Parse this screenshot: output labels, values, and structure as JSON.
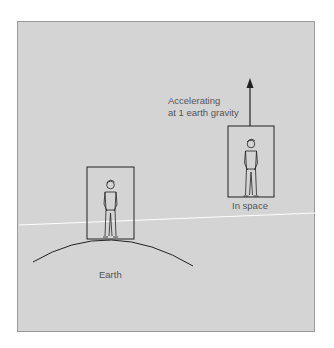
{
  "diagram": {
    "annotations": {
      "accelerating_line1": "Accelerating",
      "accelerating_line2": "at 1 earth gravity",
      "space_label": "In space",
      "earth_label": "Earth"
    },
    "colors": {
      "background": "#d4d4d4",
      "stroke": "#222222",
      "text": "#555555"
    }
  }
}
